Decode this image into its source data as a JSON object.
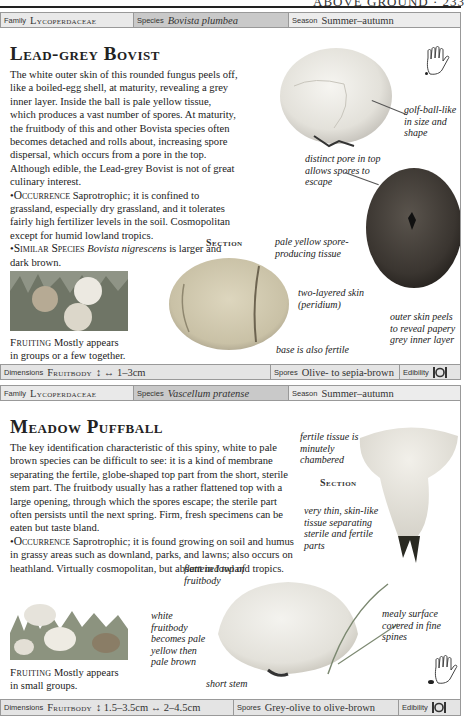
{
  "running_head": {
    "title": "ABOVE GROUND · 233"
  },
  "entries": [
    {
      "info": {
        "family_label": "Family",
        "family_value": "Lycoperdaceae",
        "species_label": "Species",
        "species_value": "Bovista plumbea",
        "season_label": "Season",
        "season_value": "Summer–autumn"
      },
      "title": "Lead-grey Bovist",
      "description": "The white outer skin of this rounded fungus peels off, like a boiled-egg shell, at maturity, revealing a grey inner layer. Inside the ball is pale yellow tissue, which produces a vast number of spores. At maturity, the fruitbody of this and other Bovista species often becomes detached and rolls about, increasing spore dispersal, which occurs from a pore in the top. Although edible, the Lead-grey Bovist is not of great culinary interest.",
      "occurrence_label": "Occurrence",
      "occurrence_text": "Saprotrophic; it is confined to grassland, especially dry grassland, and it tolerates fairly high fertilizer levels in the soil. Cosmopolitan except for humid lowland tropics.",
      "similar_label": "Similar Species",
      "similar_species": "Bovista nigrescens",
      "similar_text": "is larger and dark brown.",
      "fruiting_label": "Fruiting",
      "fruiting_text": "Mostly appears in groups or a few together.",
      "section_label": "Section",
      "annotations": [
        "golf-ball-like in size and shape",
        "distinct pore in top allows spores to escape",
        "pale yellow spore-producing tissue",
        "two-layered skin (peridium)",
        "base is also fertile",
        "outer skin peels to reveal papery grey inner layer"
      ],
      "footer": {
        "dimensions_label": "Dimensions",
        "dimensions_part": "Fruitbody",
        "dimensions_value": "↕ ↔ 1–3cm",
        "spores_label": "Spores",
        "spores_value": "Olive- to sepia-brown",
        "edibility_label": "Edibility",
        "edibility_icon": "plate-icon"
      }
    },
    {
      "info": {
        "family_label": "Family",
        "family_value": "Lycoperdaceae",
        "species_label": "Species",
        "species_value": "Vascellum pratense",
        "season_label": "Season",
        "season_value": "Summer–autumn"
      },
      "title": "Meadow Puffball",
      "description": "The key identification characteristic of this spiny, white to pale brown species can be difficult to see: it is a kind of membrane separating the fertile, globe-shaped top part from the short, sterile stem part. The fruitbody usually has a rather flattened top with a large opening, through which the spores escape; the sterile part often persists until the next spring. Firm, fresh specimens can be eaten but taste bland.",
      "occurrence_label": "Occurrence",
      "occurrence_text": "Saprotrophic; it is found growing on soil and humus in grassy areas such as downland, parks, and lawns; also occurs on heathland. Virtually cosmopolitan, but absent in lowland tropics.",
      "fruiting_label": "Fruiting",
      "fruiting_text": "Mostly appears in small groups.",
      "section_label": "Section",
      "annotations": [
        "fertile tissue is minutely chambered",
        "very thin, skin-like tissue separating sterile and fertile parts",
        "flattened top of fruitbody",
        "white fruitbody becomes pale yellow then pale brown",
        "mealy surface covered in fine spines",
        "short stem"
      ],
      "footer": {
        "dimensions_label": "Dimensions",
        "dimensions_part": "Fruitbody",
        "dimensions_value": "↕ 1.5–3.5cm ↔ 2–4.5cm",
        "spores_label": "Spores",
        "spores_value": "Grey-olive to olive-brown",
        "edibility_label": "Edibility",
        "edibility_icon": "plate-icon"
      }
    }
  ],
  "colors": {
    "info_bg": "#e9e9e9",
    "species_bg": "#c9c9c9",
    "border": "#999999"
  }
}
